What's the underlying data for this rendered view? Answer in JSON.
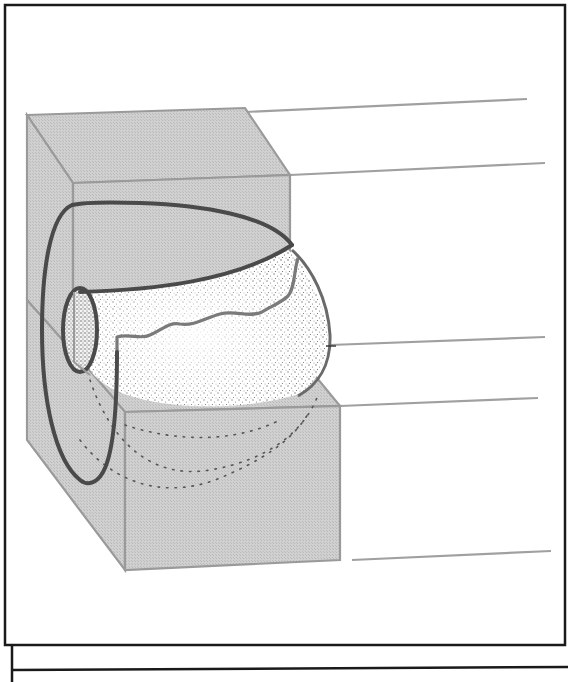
{
  "figure": {
    "colors": {
      "frame": "#1a1a1a",
      "block_fill": "#c9c9c9",
      "block_edge": "#9a9a9a",
      "spiral_stroke": "#4a4a4a",
      "stipple": "#5a5a5a",
      "guide_line": "#a0a0a0",
      "background": "#ffffff"
    },
    "guide_lines": [
      {
        "x1": 290,
        "y1": 112,
        "x2": 527,
        "y2": 99
      },
      {
        "x1": 290,
        "y1": 175,
        "x2": 545,
        "y2": 163
      },
      {
        "x1": 330,
        "y1": 345,
        "x2": 545,
        "y2": 337
      },
      {
        "x1": 340,
        "y1": 406,
        "x2": 538,
        "y2": 398
      },
      {
        "x1": 352,
        "y1": 560,
        "x2": 551,
        "y2": 551
      }
    ]
  },
  "caption": {
    "partial_text": "… … … … … … … … … … … … … … … … … … … … … … … … … … … … … … … ."
  }
}
